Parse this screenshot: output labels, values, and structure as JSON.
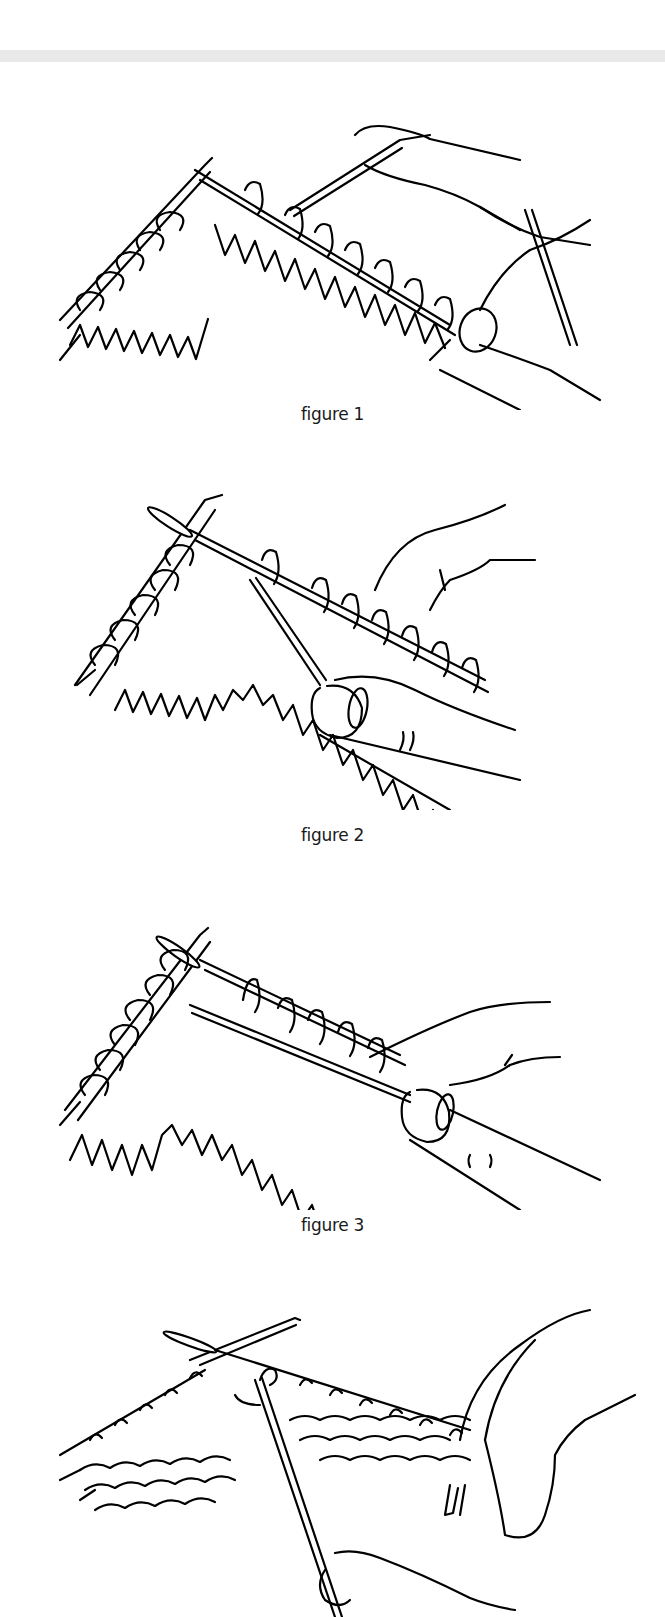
{
  "page": {
    "separator": "top-band"
  },
  "figures": [
    {
      "id": 1,
      "caption": "figure 1",
      "description": "knitting illustration: two needles with stitches, right hand holding yarn over finger"
    },
    {
      "id": 2,
      "caption": "figure 2",
      "description": "knitting illustration: right needle inserted into stitch, yarn wrapped, thumb holding yarn"
    },
    {
      "id": 3,
      "caption": "figure 3",
      "description": "knitting illustration: yarn carried across back of stitches, thumb holding yarn"
    },
    {
      "id": 4,
      "caption": "",
      "description": "knitting illustration: purl side fabric with needles crossed, yarn pulled down by lower hand"
    }
  ]
}
